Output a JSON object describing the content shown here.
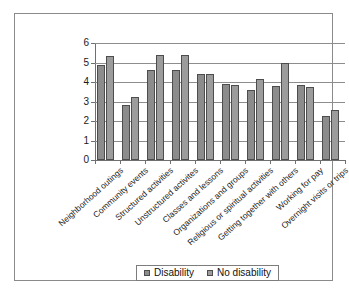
{
  "chart_data": {
    "type": "bar",
    "title": "",
    "xlabel": "",
    "ylabel": "",
    "ylim": [
      0,
      6
    ],
    "yticks": [
      0,
      1,
      2,
      3,
      4,
      5,
      6
    ],
    "grid": true,
    "legend_position": "bottom",
    "categories": [
      "Neighborhood outings",
      "Community events",
      "Structured activities",
      "Unstructured activites",
      "Classes and lessons",
      "Organizations and groups",
      "Religious or spiritual activities",
      "Getting together with others",
      "Working for pay",
      "Overnight visits or trips"
    ],
    "series": [
      {
        "name": "Disability",
        "color": "#8c8c8c",
        "values": [
          4.88,
          2.8,
          4.62,
          4.62,
          4.4,
          3.9,
          3.58,
          3.82,
          3.85,
          2.28
        ]
      },
      {
        "name": "No disability",
        "color": "#9c9c9c",
        "values": [
          5.32,
          3.25,
          5.4,
          5.4,
          4.4,
          3.87,
          4.15,
          4.95,
          3.75,
          2.58
        ]
      }
    ]
  },
  "legend": {
    "items": [
      {
        "label": "Disability"
      },
      {
        "label": "No disability"
      }
    ]
  }
}
